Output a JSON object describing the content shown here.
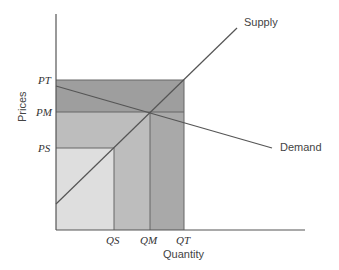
{
  "diagram": {
    "y_axis_label": "Prices",
    "x_axis_label": "Quantity",
    "price_ticks": [
      {
        "label": "PT",
        "y": 80
      },
      {
        "label": "PM",
        "y": 112
      },
      {
        "label": "PS",
        "y": 148
      }
    ],
    "quantity_ticks": [
      {
        "label": "QS",
        "x": 114
      },
      {
        "label": "QM",
        "x": 150
      },
      {
        "label": "QT",
        "x": 184
      }
    ],
    "curves": {
      "supply": {
        "label": "Supply"
      },
      "demand": {
        "label": "Demand"
      }
    },
    "colors": {
      "region_top": "#9a9a9a",
      "region_mid": "#bcbcbc",
      "region_low": "#dcdcdc",
      "region_qm_qt": "#a8a8a8",
      "region_qs_qm": "#c4c4c4",
      "line": "#555555"
    }
  }
}
